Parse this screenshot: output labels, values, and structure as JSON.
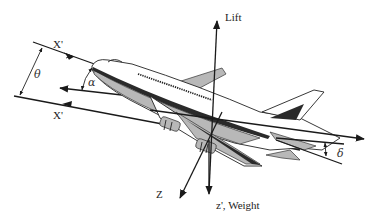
{
  "diagram": {
    "labels": {
      "x_prime_upper": "X'",
      "x_prime_lower": "X'",
      "lift": "Lift",
      "z": "Z",
      "weight": "z', Weight",
      "theta": "θ",
      "alpha": "α",
      "delta": "δ"
    },
    "colors": {
      "ink": "#1a1a1a",
      "shading": "#b8b8b8",
      "background": "#ffffff"
    }
  }
}
